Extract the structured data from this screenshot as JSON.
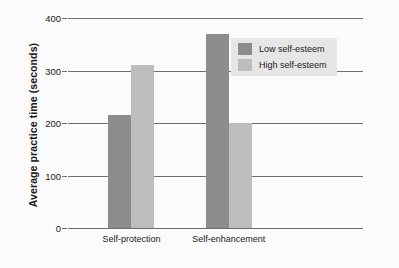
{
  "chart_data": {
    "type": "bar",
    "title": "",
    "subtitle": "",
    "xlabel": "",
    "ylabel": "Average practice time (seconds)",
    "categories": [
      "Self-protection",
      "Self-enhancement"
    ],
    "series": [
      {
        "name": "Low self-esteem",
        "color": "#8c8c8c",
        "values": [
          215,
          370
        ]
      },
      {
        "name": "High self-esteem",
        "color": "#bdbdbd",
        "values": [
          310,
          200
        ]
      }
    ],
    "ylim": [
      0,
      400
    ],
    "yticks": [
      0,
      100,
      200,
      300,
      400
    ],
    "ytick_labels": [
      "0",
      "100",
      "200",
      "300",
      "400"
    ],
    "grid": true,
    "legend_position": "upper right",
    "background": "#fbfbfb",
    "axis_color": "#6e6e6e",
    "legend_background": "#e6e6e6"
  }
}
